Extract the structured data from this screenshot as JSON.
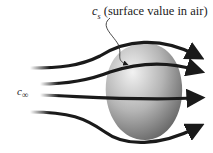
{
  "labels": {
    "surface_symbol": "c",
    "surface_subscript": "s",
    "surface_desc": " (surface value in air)",
    "freestream_symbol": "c",
    "freestream_subscript": "∞"
  },
  "figure": {
    "object": "droplet/particle",
    "streamlines": 4,
    "colors": {
      "line": "#1a1a1a",
      "blob_light": "#e6e6e6",
      "blob_dark": "#6e6e6e"
    }
  }
}
